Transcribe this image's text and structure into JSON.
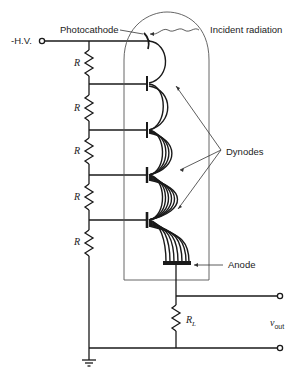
{
  "diagram": {
    "labels": {
      "hv": "-H.V.",
      "photocathode": "Photocathode",
      "incident_radiation": "Incident radiation",
      "dynodes": "Dynodes",
      "anode": "Anode",
      "resistor": "R",
      "load_resistor": "R",
      "load_resistor_sub": "L",
      "vout": "v",
      "vout_sub": "out"
    },
    "resistor_count": 5,
    "dynode_count": 4,
    "colors": {
      "line": "#1a1a1a",
      "tube": "#444444",
      "background": "#ffffff"
    }
  }
}
